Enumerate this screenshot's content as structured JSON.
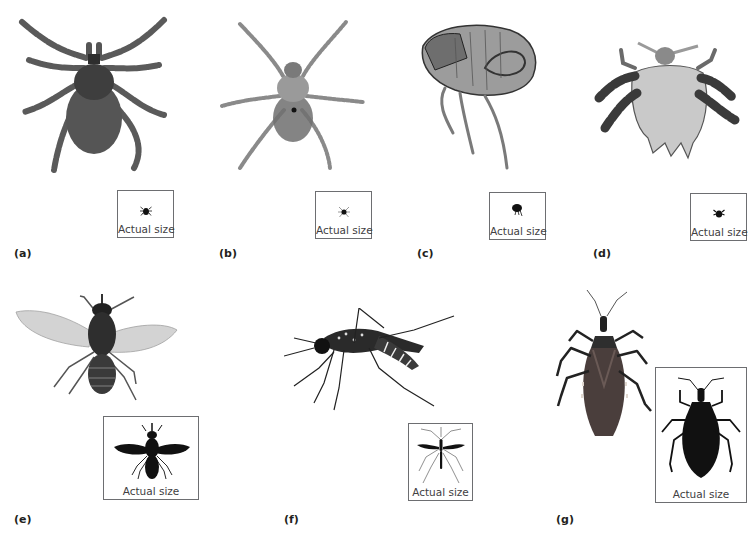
{
  "figure": {
    "caption_box_text": "Actual size",
    "panels": [
      {
        "id": "a",
        "label": "(a)",
        "organism": "tick"
      },
      {
        "id": "b",
        "label": "(b)",
        "organism": "mite"
      },
      {
        "id": "c",
        "label": "(c)",
        "organism": "flea"
      },
      {
        "id": "d",
        "label": "(d)",
        "organism": "louse"
      },
      {
        "id": "e",
        "label": "(e)",
        "organism": "tsetse-fly"
      },
      {
        "id": "f",
        "label": "(f)",
        "organism": "mosquito"
      },
      {
        "id": "g",
        "label": "(g)",
        "organism": "kissing-bug"
      }
    ]
  },
  "colors": {
    "background": "#ffffff",
    "label_text": "#231f20",
    "box_border": "#6d6e71",
    "silhouette": "#111111"
  }
}
